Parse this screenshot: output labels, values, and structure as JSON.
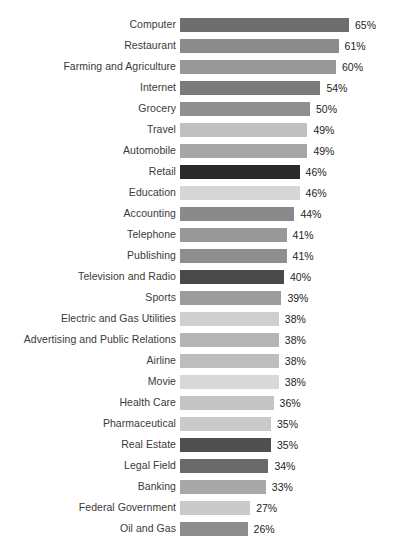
{
  "chart_data": {
    "type": "bar",
    "orientation": "horizontal",
    "title": "",
    "subtitle": "",
    "xlabel": "",
    "ylabel": "",
    "xlim": [
      0,
      65
    ],
    "grid": false,
    "legend": null,
    "value_suffix": "%",
    "categories": [
      "Computer",
      "Restaurant",
      "Farming and Agriculture",
      "Internet",
      "Grocery",
      "Travel",
      "Automobile",
      "Retail",
      "Education",
      "Accounting",
      "Telephone",
      "Publishing",
      "Television and Radio",
      "Sports",
      "Electric and Gas Utilities",
      "Advertising and Public Relations",
      "Airline",
      "Movie",
      "Health Care",
      "Pharmaceutical",
      "Real Estate",
      "Legal Field",
      "Banking",
      "Federal Government",
      "Oil and Gas"
    ],
    "values": [
      65,
      61,
      60,
      54,
      50,
      49,
      49,
      46,
      46,
      44,
      41,
      41,
      40,
      39,
      38,
      38,
      38,
      38,
      36,
      35,
      35,
      34,
      33,
      27,
      26
    ],
    "value_labels": [
      "65%",
      "61%",
      "60%",
      "54%",
      "50%",
      "49%",
      "49%",
      "46%",
      "46%",
      "44%",
      "41%",
      "41%",
      "40%",
      "39%",
      "38%",
      "38%",
      "38%",
      "38%",
      "36%",
      "35%",
      "35%",
      "34%",
      "33%",
      "27%",
      "26%"
    ],
    "bar_colors": [
      "#6e6e6e",
      "#8c8c8c",
      "#989898",
      "#7b7b7b",
      "#8f8f8f",
      "#c0c0c0",
      "#a6a6a6",
      "#2a2a2a",
      "#d6d6d6",
      "#8a8a8a",
      "#989898",
      "#8e8e8e",
      "#4a4a4a",
      "#9c9c9c",
      "#cfcfcf",
      "#b4b4b4",
      "#bdbdbd",
      "#d8d8d8",
      "#c4c4c4",
      "#cbcbcb",
      "#4f4f4f",
      "#6a6a6a",
      "#a8a8a8",
      "#c9c9c9",
      "#8d8d8d"
    ]
  }
}
